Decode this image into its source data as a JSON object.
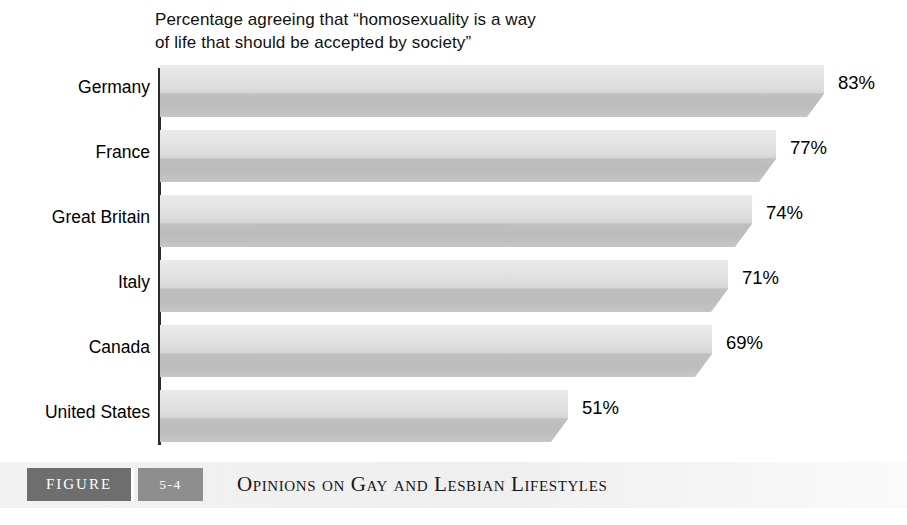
{
  "chart_data": {
    "type": "bar",
    "orientation": "horizontal",
    "title": "Percentage agreeing that “homosexuality is a way\nof life that should be accepted by society”",
    "title_line1": "Percentage agreeing that “homosexuality is a way",
    "title_line2": "of life that should be accepted by society”",
    "xlabel": "",
    "ylabel": "",
    "xlim": [
      0,
      100
    ],
    "grid": false,
    "legend": "none",
    "categories": [
      "Germany",
      "France",
      "Great Britain",
      "Italy",
      "Canada",
      "United States"
    ],
    "values": [
      83,
      77,
      74,
      71,
      69,
      51
    ],
    "value_labels": [
      "83%",
      "77%",
      "74%",
      "71%",
      "69%",
      "51%"
    ],
    "bars": [
      {
        "category": "Germany",
        "value": 83,
        "label": "83%"
      },
      {
        "category": "France",
        "value": 77,
        "label": "77%"
      },
      {
        "category": "Great Britain",
        "value": 74,
        "label": "74%"
      },
      {
        "category": "Italy",
        "value": 71,
        "label": "71%"
      },
      {
        "category": "Canada",
        "value": 69,
        "label": "69%"
      },
      {
        "category": "United States",
        "value": 51,
        "label": "51%"
      }
    ],
    "colors": {
      "bar_top": "#eaeaea",
      "bar_front": "#bfbfbf",
      "axis": "#2b2b2b",
      "text": "#000000",
      "caption_band": "#f1f1f1",
      "figure_badge": "#6e6e6e",
      "figure_number_badge": "#8e8e8e"
    }
  },
  "caption": {
    "figure_label": "FIGURE",
    "figure_number": "5-4",
    "title": "Opinions on Gay and Lesbian Lifestyles"
  }
}
